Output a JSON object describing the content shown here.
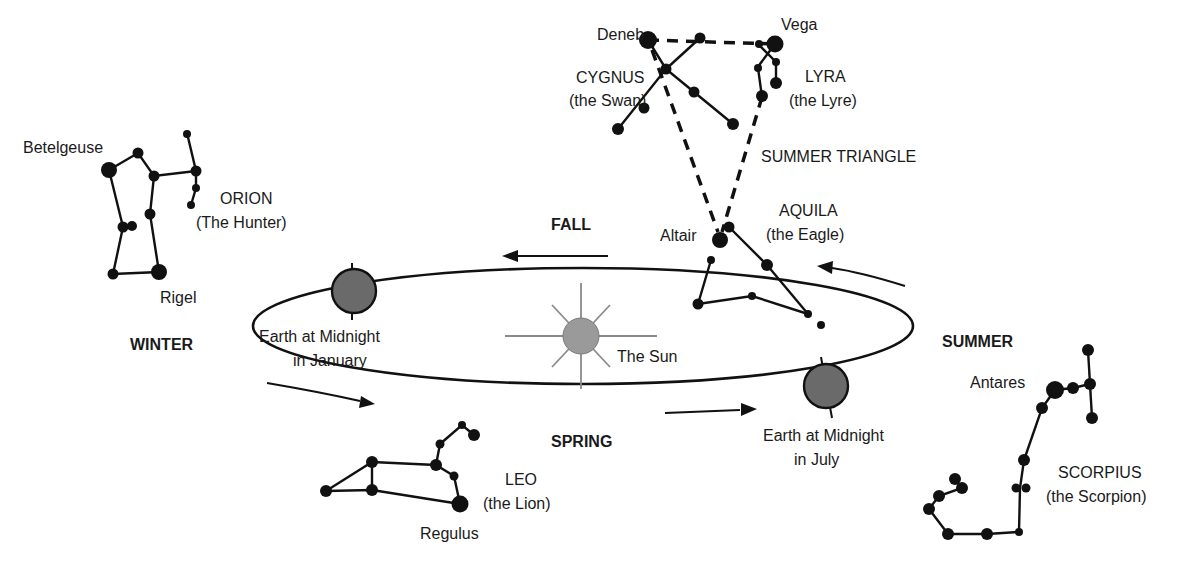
{
  "seasons": {
    "fall": "FALL",
    "winter": "WINTER",
    "spring": "SPRING",
    "summer": "SUMMER"
  },
  "sun": {
    "label": "The Sun",
    "color": "#9a9a9a"
  },
  "earth_january": {
    "line1": "Earth at Midnight",
    "line2": "in January",
    "color": "#6a6a6a"
  },
  "earth_july": {
    "line1": "Earth at Midnight",
    "line2": "in July",
    "color": "#6a6a6a"
  },
  "summer_triangle": {
    "label": "SUMMER TRIANGLE"
  },
  "constellations": {
    "cygnus": {
      "name": "CYGNUS",
      "common": "(the Swan)",
      "star": "Deneb"
    },
    "lyra": {
      "name": "LYRA",
      "common": "(the Lyre)",
      "star": "Vega"
    },
    "aquila": {
      "name": "AQUILA",
      "common": "(the Eagle)",
      "star": "Altair"
    },
    "orion": {
      "name": "ORION",
      "common": "(The Hunter)",
      "star_top": "Betelgeuse",
      "star_bottom": "Rigel"
    },
    "leo": {
      "name": "LEO",
      "common": "(the Lion)",
      "star": "Regulus"
    },
    "scorpius": {
      "name": "SCORPIUS",
      "common": "(the Scorpion)",
      "star": "Antares"
    }
  }
}
